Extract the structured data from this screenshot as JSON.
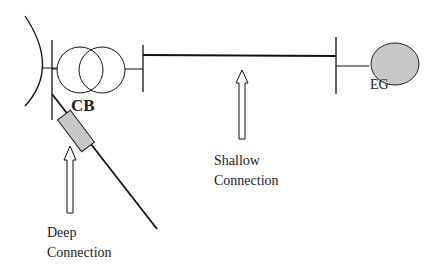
{
  "diagram": {
    "labels": {
      "circuit_breaker": "CB",
      "generator": "EG",
      "shallow_line1": "Shallow",
      "shallow_line2": "Connection",
      "deep_line1": "Deep",
      "deep_line2": "Connection"
    },
    "colors": {
      "stroke": "#111111",
      "fill_gray": "#c8c8c8",
      "background": "#ffffff"
    },
    "components": [
      "grid-source-curve",
      "bus-left",
      "transformer",
      "bus-middle",
      "transmission-line",
      "bus-right",
      "embedded-generator",
      "deep-feeder-line",
      "circuit-breaker",
      "shallow-connection-arrow",
      "deep-connection-arrow"
    ]
  }
}
